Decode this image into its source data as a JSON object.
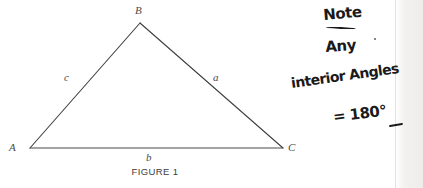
{
  "figure": {
    "caption": "FIGURE 1",
    "vertices": [
      {
        "name": "A",
        "label": "A",
        "x": 30,
        "y": 148
      },
      {
        "name": "B",
        "label": "B",
        "x": 140,
        "y": 23
      },
      {
        "name": "C",
        "label": "C",
        "x": 283,
        "y": 148
      }
    ],
    "sides": [
      {
        "name": "a",
        "label": "a",
        "between": "B-C"
      },
      {
        "name": "b",
        "label": "b",
        "between": "A-C"
      },
      {
        "name": "c",
        "label": "c",
        "between": "A-B"
      }
    ],
    "line_color": "#3f3f3f",
    "label_color": "#4a4a4a"
  },
  "annotation": {
    "ink_color": "#1a1a1a",
    "lines": [
      {
        "text": "Note",
        "underlined": true
      },
      {
        "text": "Any",
        "underlined": false
      },
      {
        "text": "interior Angles",
        "underlined": false
      },
      {
        "text": "= 180°",
        "underlined": false
      }
    ],
    "line_1": "Note",
    "line_2": "Any",
    "line_3": "interior Angles",
    "line_4": "= 180°",
    "full_text": "Note Any interior Angles = 180°"
  },
  "page": {
    "background": "#ffffff",
    "edge_color": "#eeedeb"
  }
}
